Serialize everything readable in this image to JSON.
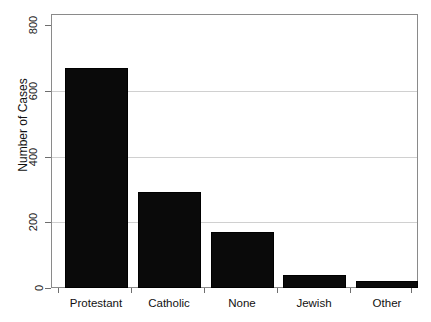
{
  "chart_data": {
    "type": "bar",
    "title": "",
    "subtitle": "",
    "xlabel": "",
    "ylabel": "Number of Cases",
    "categories": [
      "Protestant",
      "Catholic",
      "None",
      "Jewish",
      "Other"
    ],
    "values": [
      670,
      292,
      170,
      40,
      22
    ],
    "series": [
      {
        "name": "Number of Cases",
        "values": [
          670,
          292,
          170,
          40,
          22
        ]
      }
    ],
    "ylim": [
      0,
      830
    ],
    "yticks": [
      0,
      200,
      400,
      600,
      800
    ],
    "ytick_labels": [
      "0",
      "200",
      "400",
      "600",
      "800"
    ],
    "xtick_labels": [
      "Protestant",
      "Catholic",
      "None",
      "Jewish",
      "Other"
    ],
    "grid": "horizontal",
    "gridlines_at": [
      200,
      400,
      600
    ],
    "legend": "none",
    "legend_position": "none",
    "annotations": [],
    "bar_color": "#0a0a0a",
    "grid_color": "#d0d0d0",
    "frame_color": "#8a8a8a",
    "background_color": "#ffffff",
    "text_color": "#111111"
  }
}
